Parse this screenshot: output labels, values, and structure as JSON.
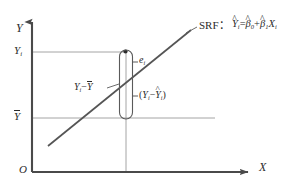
{
  "figure": {
    "title_caption": "",
    "colors": {
      "axis": "#4a4a4a",
      "line": "#555555",
      "grid": "#9a9a9a",
      "text": "#2b2b2b",
      "background": "#ffffff"
    }
  },
  "axes": {
    "y_label": "Y",
    "x_label": "X",
    "origin_label": "O"
  },
  "ticks": {
    "y_upper": {
      "base": "Y",
      "sub": "i",
      "text": "Yi"
    },
    "y_mean": {
      "base": "Y",
      "overbar": true,
      "text": "Ȳ"
    }
  },
  "annotations": {
    "srf_prefix": "SRF",
    "srf_colon": "：",
    "srf_equation": {
      "lhs_base": "Y",
      "lhs_hat": "^",
      "lhs_sub": "i",
      "equals": "=",
      "beta0_base": "β",
      "beta0_hat": "^",
      "beta0_sub": "0",
      "plus": "+",
      "beta1_base": "β",
      "beta1_hat": "^",
      "beta1_sub": "1",
      "x_base": "X",
      "x_sub": "i",
      "text": "Ŷi = β̂0 + β̂1 Xi"
    },
    "residual_symbol": {
      "base": "e",
      "sub": "i",
      "text": "ei"
    },
    "total_deviation": {
      "left_base": "Y",
      "left_sub": "i",
      "minus": "−",
      "right_base": "Y",
      "right_overbar": true,
      "text": "Yi − Ȳ"
    },
    "explained_deviation": {
      "open": "(",
      "left_base": "Y",
      "left_sub": "i",
      "minus": "−",
      "right_base": "Y",
      "right_hat": "^",
      "right_sub": "i",
      "close": ")",
      "text": "(Yi − Ŷi)"
    }
  },
  "geometry": {
    "y_axis_x": 32,
    "x_axis_y": 172,
    "grid_yi": 52,
    "grid_ybar": 118,
    "point_x": 126,
    "capsule_top": 50,
    "capsule_bottom": 119
  }
}
